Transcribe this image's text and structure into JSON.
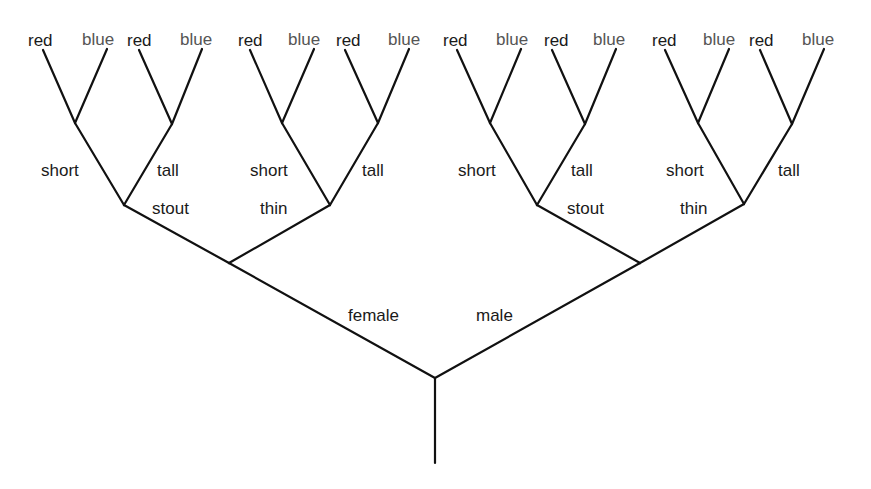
{
  "diagram": {
    "type": "binary-decision-tree",
    "colors": {
      "line": "#111111",
      "text": "#1a1a1a",
      "blue_leaf_text": "#555555",
      "background": "#ffffff"
    },
    "root": {
      "x": 435,
      "y": 378,
      "trunk_end_y": 463
    },
    "level1": [
      {
        "label": "female",
        "node": {
          "x": 229,
          "y": 263
        },
        "label_pos": {
          "x": 348,
          "y": 321
        }
      },
      {
        "label": "male",
        "node": {
          "x": 640,
          "y": 263
        },
        "label_pos": {
          "x": 476,
          "y": 321
        }
      }
    ],
    "level2": [
      {
        "parent": 0,
        "label": "stout",
        "node": {
          "x": 124,
          "y": 205
        },
        "label_pos": {
          "x": 152,
          "y": 214
        }
      },
      {
        "parent": 0,
        "label": "thin",
        "node": {
          "x": 330,
          "y": 205
        },
        "label_pos": {
          "x": 260,
          "y": 214
        }
      },
      {
        "parent": 1,
        "label": "stout",
        "node": {
          "x": 537,
          "y": 205
        },
        "label_pos": {
          "x": 567,
          "y": 214
        }
      },
      {
        "parent": 1,
        "label": "thin",
        "node": {
          "x": 744,
          "y": 204
        },
        "label_pos": {
          "x": 680,
          "y": 214
        }
      }
    ],
    "level3": [
      {
        "parent": 0,
        "label": "short",
        "node": {
          "x": 75,
          "y": 123
        },
        "label_pos": {
          "x": 41,
          "y": 176
        }
      },
      {
        "parent": 0,
        "label": "tall",
        "node": {
          "x": 172,
          "y": 124
        },
        "label_pos": {
          "x": 157,
          "y": 176
        }
      },
      {
        "parent": 1,
        "label": "short",
        "node": {
          "x": 282,
          "y": 123
        },
        "label_pos": {
          "x": 250,
          "y": 176
        }
      },
      {
        "parent": 1,
        "label": "tall",
        "node": {
          "x": 378,
          "y": 123
        },
        "label_pos": {
          "x": 362,
          "y": 176
        }
      },
      {
        "parent": 2,
        "label": "short",
        "node": {
          "x": 490,
          "y": 123
        },
        "label_pos": {
          "x": 458,
          "y": 176
        }
      },
      {
        "parent": 2,
        "label": "tall",
        "node": {
          "x": 585,
          "y": 124
        },
        "label_pos": {
          "x": 571,
          "y": 176
        }
      },
      {
        "parent": 3,
        "label": "short",
        "node": {
          "x": 698,
          "y": 123
        },
        "label_pos": {
          "x": 666,
          "y": 176
        }
      },
      {
        "parent": 3,
        "label": "tall",
        "node": {
          "x": 792,
          "y": 124
        },
        "label_pos": {
          "x": 778,
          "y": 176
        }
      }
    ],
    "leaves": [
      {
        "parent": 0,
        "label": "red",
        "tip": {
          "x": 43,
          "y": 50
        },
        "label_pos": {
          "x": 28,
          "y": 46
        }
      },
      {
        "parent": 0,
        "label": "blue",
        "tip": {
          "x": 107,
          "y": 49
        },
        "label_pos": {
          "x": 82,
          "y": 45
        }
      },
      {
        "parent": 1,
        "label": "red",
        "tip": {
          "x": 139,
          "y": 50
        },
        "label_pos": {
          "x": 127,
          "y": 46
        }
      },
      {
        "parent": 1,
        "label": "blue",
        "tip": {
          "x": 202,
          "y": 49
        },
        "label_pos": {
          "x": 180,
          "y": 45
        }
      },
      {
        "parent": 2,
        "label": "red",
        "tip": {
          "x": 250,
          "y": 50
        },
        "label_pos": {
          "x": 238,
          "y": 46
        }
      },
      {
        "parent": 2,
        "label": "blue",
        "tip": {
          "x": 314,
          "y": 49
        },
        "label_pos": {
          "x": 288,
          "y": 45
        }
      },
      {
        "parent": 3,
        "label": "red",
        "tip": {
          "x": 345,
          "y": 50
        },
        "label_pos": {
          "x": 336,
          "y": 46
        }
      },
      {
        "parent": 3,
        "label": "blue",
        "tip": {
          "x": 409,
          "y": 49
        },
        "label_pos": {
          "x": 388,
          "y": 45
        }
      },
      {
        "parent": 4,
        "label": "red",
        "tip": {
          "x": 457,
          "y": 50
        },
        "label_pos": {
          "x": 443,
          "y": 46
        }
      },
      {
        "parent": 4,
        "label": "blue",
        "tip": {
          "x": 521,
          "y": 49
        },
        "label_pos": {
          "x": 496,
          "y": 45
        }
      },
      {
        "parent": 5,
        "label": "red",
        "tip": {
          "x": 552,
          "y": 50
        },
        "label_pos": {
          "x": 544,
          "y": 46
        }
      },
      {
        "parent": 5,
        "label": "blue",
        "tip": {
          "x": 616,
          "y": 49
        },
        "label_pos": {
          "x": 593,
          "y": 45
        }
      },
      {
        "parent": 6,
        "label": "red",
        "tip": {
          "x": 665,
          "y": 50
        },
        "label_pos": {
          "x": 652,
          "y": 46
        }
      },
      {
        "parent": 6,
        "label": "blue",
        "tip": {
          "x": 729,
          "y": 49
        },
        "label_pos": {
          "x": 703,
          "y": 45
        }
      },
      {
        "parent": 7,
        "label": "red",
        "tip": {
          "x": 760,
          "y": 50
        },
        "label_pos": {
          "x": 749,
          "y": 46
        }
      },
      {
        "parent": 7,
        "label": "blue",
        "tip": {
          "x": 824,
          "y": 49
        },
        "label_pos": {
          "x": 802,
          "y": 45
        }
      }
    ]
  }
}
